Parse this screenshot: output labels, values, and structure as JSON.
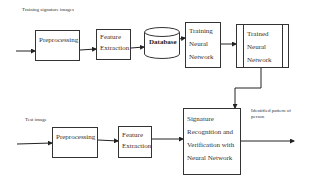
{
  "diagram": {
    "training_label": "Training signature images",
    "test_label": "Test image",
    "output_label": "Identified pattern of person",
    "nodes": {
      "train_preprocessing": "Preprocessing",
      "train_feature_extraction": "Feature Extraction",
      "database": "Database",
      "training_nn": "Training Neural Network",
      "trained_nn": "Trained Neural Network",
      "test_preprocessing": "Preprocessing",
      "test_feature_extraction": "Feature Extraction",
      "signature_recognition": "Signature Recognition and Verification with Neural Network"
    },
    "edges": [
      [
        "training_input",
        "train_preprocessing"
      ],
      [
        "train_preprocessing",
        "train_feature_extraction"
      ],
      [
        "train_feature_extraction",
        "database"
      ],
      [
        "database",
        "training_nn"
      ],
      [
        "training_nn",
        "trained_nn"
      ],
      [
        "trained_nn",
        "signature_recognition"
      ],
      [
        "test_input",
        "test_preprocessing"
      ],
      [
        "test_preprocessing",
        "test_feature_extraction"
      ],
      [
        "test_feature_extraction",
        "signature_recognition"
      ],
      [
        "signature_recognition",
        "output"
      ]
    ]
  }
}
